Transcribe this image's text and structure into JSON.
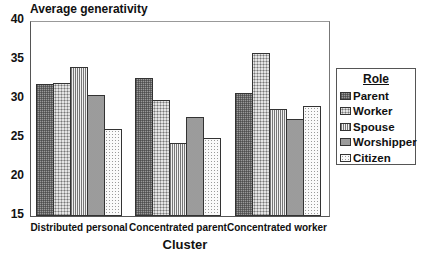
{
  "chart_data": {
    "type": "bar",
    "title": "Average generativity",
    "xlabel": "Cluster",
    "ylabel": "Average generativity",
    "ylim": [
      15,
      40
    ],
    "yticks": [
      15,
      20,
      25,
      30,
      35,
      40
    ],
    "grid": false,
    "legend_position": "right",
    "legend_title": "Role",
    "categories": [
      "Distributed personal",
      "Concentrated parent",
      "Concentrated worker"
    ],
    "series": [
      {
        "name": "Parent",
        "values": [
          32.0,
          32.8,
          30.9
        ]
      },
      {
        "name": "Worker",
        "values": [
          32.1,
          30.0,
          36.0
        ]
      },
      {
        "name": "Spouse",
        "values": [
          34.2,
          24.4,
          28.8
        ]
      },
      {
        "name": "Worshipper",
        "values": [
          30.6,
          27.8,
          27.5
        ]
      },
      {
        "name": "Citizen",
        "values": [
          26.2,
          25.1,
          29.2
        ]
      }
    ]
  },
  "legend": {
    "title": "Role",
    "items": [
      "Parent",
      "Worker",
      "Spouse",
      "Worshipper",
      "Citizen"
    ]
  },
  "yticks_labels": [
    "40",
    "35",
    "30",
    "25",
    "20",
    "15"
  ]
}
